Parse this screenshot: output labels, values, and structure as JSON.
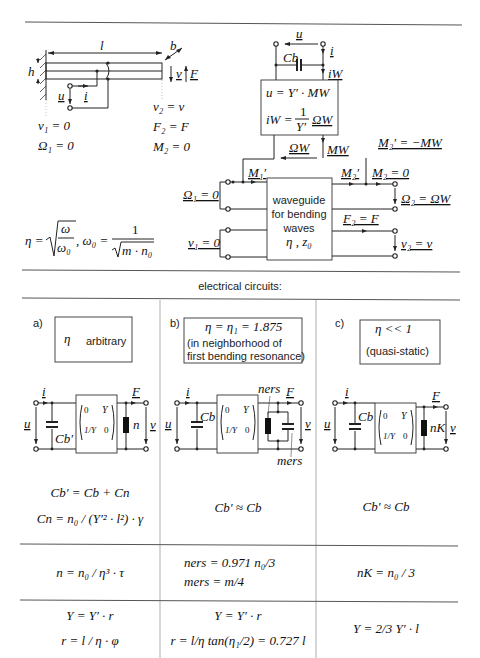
{
  "beam": {
    "length_label": "l",
    "width_label": "b",
    "height_label": "h",
    "velocity_label": "v",
    "force_label": "F",
    "voltage_label": "u",
    "current_label": "i",
    "left_bc": [
      "v₁ = 0",
      "Ω₁ = 0"
    ],
    "right_bc": [
      "v₂ = v",
      "F₂ = F",
      "M₂ = 0"
    ]
  },
  "transducer": {
    "voltage_label": "u",
    "current_label": "i",
    "current_w_label": "iW",
    "capacitor_label": "Cb",
    "eq1": "u = Y′ · MW",
    "eq2_lhs": "iW =",
    "eq2_num": "1",
    "eq2_den": "Y′",
    "eq2_rhs": "ΩW",
    "omega_w_label": "ΩW",
    "m_w_label": "MW",
    "m1_prime": "M₁′",
    "m2_prime": "M₂′",
    "m2_zero": "M₂ = 0",
    "m2_relation": "M₂′ = −MW",
    "omega1": "Ω₁ = 0",
    "v1": "v₁ = 0",
    "omega2": "Ω₂ = ΩW",
    "f2": "F₂ = F",
    "v2": "v₂ = v",
    "waveguide_lines": [
      "waveguide",
      "for bending",
      "waves"
    ],
    "waveguide_params": "η ,  z₀"
  },
  "formula": {
    "eta_lhs": "η =",
    "eta_num": "ω",
    "eta_den": "ω₀",
    "omega0_lhs": ", ω₀ =",
    "omega0_num": "1",
    "omega0_den": "m · n₀"
  },
  "section_title": "electrical circuits:",
  "cases": [
    {
      "tag": "a)",
      "box_line1": "η",
      "box_line1_extra": "arbitrary",
      "box_line2": "",
      "cap_label": "Cb′",
      "load_label": "n",
      "matrix": [
        "0",
        "Y",
        "1/Y",
        "0"
      ],
      "eq_lines": [
        "Cb′ = Cb + Cn",
        "Cn = n₀ / (Y′² · l²) · γ"
      ],
      "compliance": "n = n₀ / η³ · τ",
      "admittance": [
        "Y = Y′ · r",
        "r = l / η · φ"
      ]
    },
    {
      "tag": "b)",
      "box_line1": "η = η₁ = 1.875",
      "box_line2": "(in neighborhood of",
      "box_line3": "first bending resonance)",
      "cap_label": "Cb",
      "load_label": "ners",
      "mass_label": "mers",
      "matrix": [
        "0",
        "Y",
        "1/Y",
        "0"
      ],
      "eq_lines": [
        "Cb′ ≈ Cb"
      ],
      "compliance": [
        "ners = 0.971 n₀/3",
        "mers = m/4"
      ],
      "admittance": [
        "Y = Y′ · r",
        "r = l/η tan(η₁/2) = 0.727 l"
      ]
    },
    {
      "tag": "c)",
      "box_line1": "η << 1",
      "box_line2": "(quasi-static)",
      "cap_label": "Cb",
      "load_label": "nK",
      "matrix": [
        "0",
        "Y",
        "1/Y",
        "0"
      ],
      "eq_lines": [
        "Cb′ ≈ Cb"
      ],
      "compliance": "nK = n₀ / 3",
      "admittance": [
        "Y = 2/3 Y′ · l"
      ]
    }
  ],
  "colors": {
    "line": "#222222",
    "grid": "#999999",
    "background": "#ffffff"
  }
}
